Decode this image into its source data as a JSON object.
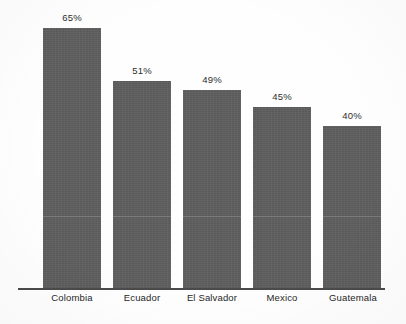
{
  "chart_data": {
    "type": "bar",
    "title": "",
    "subtitle": "",
    "xlabel": "",
    "ylabel": "",
    "ylim": [
      0,
      72
    ],
    "grid": false,
    "legend": "none",
    "orientation": "vertical",
    "bar_color": "#5e5e5e",
    "axis_color": "#4a4a4a",
    "label_color": "#262626",
    "background": "#ffffff",
    "value_label_format": "{value}%",
    "categories": [
      "Colombia",
      "Ecuador",
      "El Salvador",
      "Mexico",
      "Guatemala"
    ],
    "values": [
      65,
      51,
      49,
      45,
      40
    ],
    "value_labels": [
      "65%",
      "51%",
      "49%",
      "45%",
      "40%"
    ],
    "points": [
      {
        "category": "Colombia",
        "value": 65,
        "label": "65%"
      },
      {
        "category": "Ecuador",
        "value": 51,
        "label": "51%"
      },
      {
        "category": "El Salvador",
        "value": 49,
        "label": "49%"
      },
      {
        "category": "Mexico",
        "value": 45,
        "label": "45%"
      },
      {
        "category": "Guatemala",
        "value": 40,
        "label": "40%"
      }
    ]
  },
  "bars": [
    {
      "label": "65%",
      "name": "Colombia",
      "left": 43,
      "width": 58,
      "top": 28,
      "label_top": 12
    },
    {
      "label": "51%",
      "name": "Ecuador",
      "left": 113,
      "width": 58,
      "top": 81,
      "label_top": 65
    },
    {
      "label": "49%",
      "name": "El Salvador",
      "left": 183,
      "width": 58,
      "top": 90,
      "label_top": 74
    },
    {
      "label": "45%",
      "name": "Mexico",
      "left": 253,
      "width": 58,
      "top": 107,
      "label_top": 91
    },
    {
      "label": "40%",
      "name": "Guatemala",
      "left": 323,
      "width": 58,
      "top": 126,
      "label_top": 110
    }
  ],
  "category_labels": [
    {
      "text": "Colombia",
      "left": 36,
      "width": 72
    },
    {
      "text": "Ecuador",
      "left": 108,
      "width": 68
    },
    {
      "text": "El Salvador",
      "left": 174,
      "width": 76
    },
    {
      "text": "Mexico",
      "left": 249,
      "width": 66
    },
    {
      "text": "Guatemala",
      "left": 316,
      "width": 74
    }
  ]
}
